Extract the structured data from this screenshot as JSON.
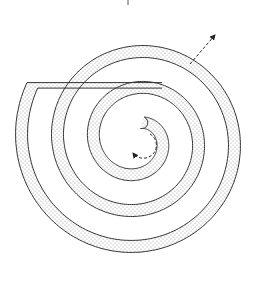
{
  "diagram": {
    "type": "spiral",
    "center": [
      137,
      140
    ],
    "turns": 3,
    "band_width": 12,
    "colors": {
      "stroke": "#333333",
      "dot": "#9a9a9a",
      "background": "#ffffff",
      "arrow": "#222222"
    },
    "arrows": [
      {
        "name": "outward-arrow",
        "style": "dashed",
        "from": [
          190,
          63
        ],
        "to": [
          216,
          34
        ]
      },
      {
        "name": "rotation-arrow",
        "style": "dashed",
        "direction": "counterclockwise"
      }
    ],
    "labels": []
  }
}
